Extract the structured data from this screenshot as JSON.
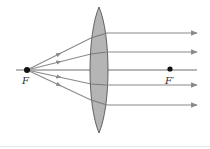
{
  "diagram": {
    "colors": {
      "background": "#ffffff",
      "ray": "#8a8a8a",
      "axis": "#6f6f6f",
      "lens_fill": "#b5b5b5",
      "lens_stroke": "#555555",
      "point": "#111111",
      "label": "#333333",
      "rule": "#e6e6e6"
    },
    "focal_points": [
      {
        "id": "F",
        "label": "F",
        "x": 27,
        "y": 70,
        "label_x": 22,
        "label_y": 84
      },
      {
        "id": "F-prime",
        "label": "F′",
        "x": 170,
        "y": 69,
        "label_x": 165,
        "label_y": 84
      }
    ],
    "lens": {
      "type": "biconvex",
      "center_x": 99,
      "top_y": 7,
      "bottom_y": 133,
      "half_width": 9
    },
    "optical_axis": {
      "x1": 16,
      "x2": 197,
      "y": 70
    },
    "rays": [
      {
        "enter_x": 91,
        "enter_y": 38,
        "exit_x": 107,
        "exit_y": 33,
        "end_x": 197
      },
      {
        "enter_x": 91,
        "enter_y": 54,
        "exit_x": 107,
        "exit_y": 52,
        "end_x": 197
      },
      {
        "enter_x": 91,
        "enter_y": 70,
        "exit_x": 107,
        "exit_y": 70,
        "end_x": 197
      },
      {
        "enter_x": 91,
        "enter_y": 84,
        "exit_x": 107,
        "exit_y": 85,
        "end_x": 197
      },
      {
        "enter_x": 91,
        "enter_y": 100,
        "exit_x": 107,
        "exit_y": 105,
        "end_x": 197
      }
    ]
  }
}
